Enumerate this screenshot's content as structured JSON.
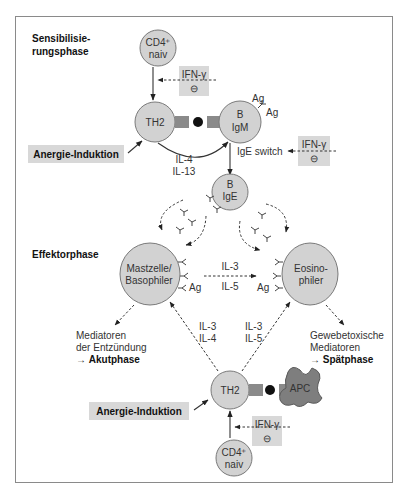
{
  "phases": {
    "sensitization": [
      "Sensibilisie-",
      "rungsphase"
    ],
    "effector": "Effektorphase"
  },
  "cells": {
    "cd4_top": [
      "CD4⁺",
      "naiv"
    ],
    "th2_top": "TH2",
    "b_igm": [
      "B",
      "IgM"
    ],
    "b_ige": [
      "B",
      "IgE"
    ],
    "mast": [
      "Mastzelle/",
      "Basophiler"
    ],
    "eos": [
      "Eosino-",
      "philer"
    ],
    "th2_bottom": "TH2",
    "apc": "APC",
    "cd4_bottom": [
      "CD4⁺",
      "naiv"
    ]
  },
  "inhibitors": {
    "label": "IFN-γ",
    "symbol": "⊖"
  },
  "anergy": "Anergie-Induktion",
  "labels": {
    "ag": "Ag",
    "ige_switch": "IgE switch",
    "il4_il13": [
      "IL-4",
      "IL-13"
    ],
    "il3_il5_mid": [
      "IL-3",
      "IL-5"
    ],
    "il3_il4": [
      "IL-3",
      "IL-4"
    ],
    "il3_il5": [
      "IL-3",
      "IL-5"
    ]
  },
  "outcomes": {
    "acute": [
      "Mediatoren",
      "der Entzündung",
      "→ ",
      "Akutphase"
    ],
    "late": [
      "Gewebetoxische",
      "Mediatoren",
      "→ ",
      "Spätphase"
    ]
  },
  "colors": {
    "cell_fill": "#d2d2d2",
    "box_fill": "#d8d8d8",
    "apc_fill": "#7e7e7e",
    "frame": "#888888"
  }
}
